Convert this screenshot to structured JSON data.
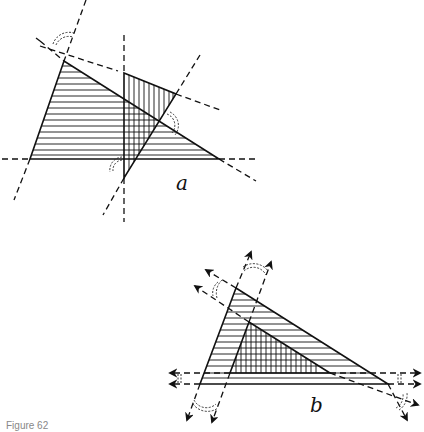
{
  "figure": {
    "caption": "Figure 62",
    "panels": [
      {
        "label": "a",
        "description": "Two overlapping triangles; one horizontally hatched, one vertically hatched; sides extended as dashed lines with exterior angle arcs",
        "triangle_horizontal_hatch": [
          [
            64,
            61
          ],
          [
            30,
            159
          ],
          [
            219,
            159
          ]
        ],
        "triangle_vertical_hatch": [
          [
            124,
            73
          ],
          [
            176,
            94
          ],
          [
            124,
            178
          ]
        ]
      },
      {
        "label": "b",
        "description": "Triangle with an inner similar triangle (cross-hatched) formed by parallel lines; extensions with arrows and angle arcs",
        "triangle_outer": [
          [
            236,
            288
          ],
          [
            200,
            384
          ],
          [
            388,
            384
          ]
        ],
        "triangle_inner": [
          [
            249,
            322
          ],
          [
            230,
            373
          ],
          [
            330,
            373
          ]
        ]
      }
    ]
  }
}
